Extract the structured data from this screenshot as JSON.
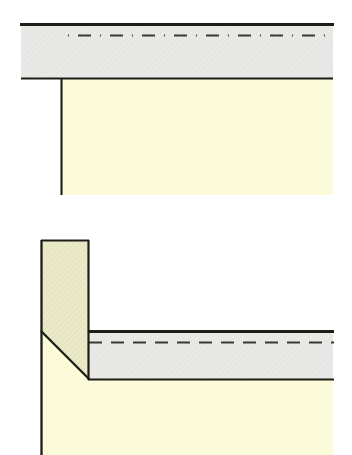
{
  "document": {
    "title": "",
    "kind": "technical-cross-section-diagram-pair",
    "background_color": "#ffffff",
    "canvas": {
      "width": 352,
      "height": 455
    }
  },
  "palette": {
    "paper_white": "#ffffff",
    "hatched_gray": "#e9e9e7",
    "cream_yellow": "#fbfbd9",
    "olive_cream": "#e9e9c6",
    "outline_dark": "#1d1d17",
    "dash_dark": "#3a3a32"
  },
  "figures": [
    {
      "id": "figure-top",
      "name": "horizontal-slab-cross-section",
      "labels": [],
      "regions": [
        {
          "name": "upper-hatched-band",
          "fill": "#e9e9e7",
          "bounds": {
            "x": 21,
            "y": 24,
            "width": 312,
            "height": 54
          }
        },
        {
          "name": "lower-cream-body",
          "fill": "#fbfbd9",
          "bounds": {
            "x": 61,
            "y": 78,
            "width": 272,
            "height": 117
          }
        }
      ],
      "strokes": [
        {
          "name": "top-edge-line",
          "style": "solid-heavy",
          "color": "#1d1d17",
          "width": 2.6,
          "from": {
            "x": 21,
            "y": 24
          },
          "to": {
            "x": 333,
            "y": 24
          }
        },
        {
          "name": "centerline-dashed",
          "style": "dash-dot",
          "color": "#3a3a32",
          "width": 2,
          "from": {
            "x": 68,
            "y": 35
          },
          "to": {
            "x": 333,
            "y": 35
          }
        },
        {
          "name": "band-bottom-line",
          "style": "solid",
          "color": "#1d1d17",
          "width": 2.2,
          "from": {
            "x": 21,
            "y": 78
          },
          "to": {
            "x": 333,
            "y": 78
          }
        },
        {
          "name": "left-vertical-line",
          "style": "solid",
          "color": "#1d1d17",
          "width": 2,
          "from": {
            "x": 61,
            "y": 78
          },
          "to": {
            "x": 61,
            "y": 195
          }
        }
      ]
    },
    {
      "id": "figure-bottom",
      "name": "corner-haunch-cross-section",
      "labels": [],
      "regions": [
        {
          "name": "vertical-column-olive",
          "fill": "#e9e9c6",
          "outline": "polygon 41,240 89,240 89,379 89,379 41,331"
        },
        {
          "name": "horizontal-hatched-band",
          "fill": "#e9e9e7",
          "bounds": {
            "x": 89,
            "y": 331,
            "width": 244,
            "height": 48
          }
        },
        {
          "name": "lower-cream-body",
          "fill": "#fbfbd9",
          "outline": "polygon 41,331 89,379 333,379 333,455 41,455"
        }
      ],
      "strokes": [
        {
          "name": "column-left-vertical",
          "style": "solid",
          "color": "#1d1d17",
          "width": 2.2,
          "from": {
            "x": 41,
            "y": 240
          },
          "to": {
            "x": 41,
            "y": 455
          }
        },
        {
          "name": "column-right-vertical",
          "style": "solid",
          "color": "#1d1d17",
          "width": 2.2,
          "from": {
            "x": 89,
            "y": 240
          },
          "to": {
            "x": 89,
            "y": 379
          }
        },
        {
          "name": "column-top-line",
          "style": "solid",
          "color": "#1d1d17",
          "width": 2.2,
          "from": {
            "x": 41,
            "y": 240
          },
          "to": {
            "x": 89,
            "y": 240
          }
        },
        {
          "name": "haunch-diagonal",
          "style": "solid",
          "color": "#1d1d17",
          "width": 2.2,
          "from": {
            "x": 41,
            "y": 331
          },
          "to": {
            "x": 89,
            "y": 379
          }
        },
        {
          "name": "band-top-line",
          "style": "solid-heavy",
          "color": "#1d1d17",
          "width": 2.6,
          "from": {
            "x": 89,
            "y": 331
          },
          "to": {
            "x": 333,
            "y": 331
          }
        },
        {
          "name": "centerline-dashed",
          "style": "dash-dot",
          "color": "#3a3a32",
          "width": 2,
          "from": {
            "x": 89,
            "y": 342
          },
          "to": {
            "x": 333,
            "y": 342
          }
        },
        {
          "name": "band-bottom-line",
          "style": "solid",
          "color": "#1d1d17",
          "width": 2.2,
          "from": {
            "x": 89,
            "y": 379
          },
          "to": {
            "x": 333,
            "y": 379
          }
        }
      ]
    }
  ]
}
